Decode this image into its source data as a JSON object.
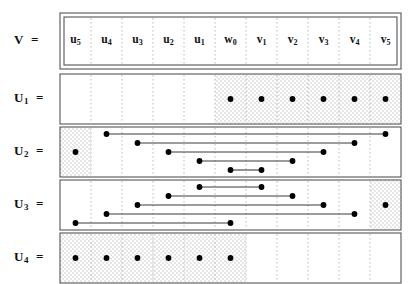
{
  "figure": {
    "title": ""
  },
  "row_labels": [
    {
      "name": "V",
      "sub": "",
      "eq": "="
    },
    {
      "name": "U",
      "sub": "1",
      "eq": "="
    },
    {
      "name": "U",
      "sub": "2",
      "eq": "="
    },
    {
      "name": "U",
      "sub": "3",
      "eq": "="
    },
    {
      "name": "U",
      "sub": "4",
      "eq": "="
    }
  ],
  "columns": [
    {
      "id": "u5",
      "base": "u",
      "sub": "5"
    },
    {
      "id": "u4",
      "base": "u",
      "sub": "4"
    },
    {
      "id": "u3",
      "base": "u",
      "sub": "3"
    },
    {
      "id": "u2",
      "base": "u",
      "sub": "2"
    },
    {
      "id": "u1",
      "base": "u",
      "sub": "1"
    },
    {
      "id": "w0",
      "base": "w",
      "sub": "0"
    },
    {
      "id": "v1",
      "base": "v",
      "sub": "1"
    },
    {
      "id": "v2",
      "base": "v",
      "sub": "2"
    },
    {
      "id": "v3",
      "base": "v",
      "sub": "3"
    },
    {
      "id": "v4",
      "base": "v",
      "sub": "4"
    },
    {
      "id": "v5",
      "base": "v",
      "sub": "5"
    }
  ],
  "rows": {
    "U1": {
      "shaded_columns": [
        "w0",
        "v1",
        "v2",
        "v3",
        "v4",
        "v5"
      ],
      "dots": [
        "w0",
        "v1",
        "v2",
        "v3",
        "v4",
        "v5"
      ],
      "segments": []
    },
    "U2": {
      "shaded_columns": [
        "u5"
      ],
      "dots": [
        "u5"
      ],
      "segments": [
        {
          "from": "u4",
          "to": "v5",
          "level": 1
        },
        {
          "from": "u3",
          "to": "v4",
          "level": 2
        },
        {
          "from": "u2",
          "to": "v3",
          "level": 3
        },
        {
          "from": "u1",
          "to": "v2",
          "level": 4
        },
        {
          "from": "w0",
          "to": "v1",
          "level": 5
        }
      ]
    },
    "U3": {
      "shaded_columns": [
        "v5"
      ],
      "dots": [
        "v5"
      ],
      "segments": [
        {
          "from": "u1",
          "to": "v1",
          "level": 1
        },
        {
          "from": "u2",
          "to": "v2",
          "level": 2
        },
        {
          "from": "u3",
          "to": "v3",
          "level": 3
        },
        {
          "from": "u4",
          "to": "v4",
          "level": 4
        },
        {
          "from": "u5",
          "to": "w0",
          "level": 5
        }
      ]
    },
    "U4": {
      "shaded_columns": [
        "u5",
        "u4",
        "u3",
        "u2",
        "u1",
        "w0"
      ],
      "dots": [
        "u5",
        "u4",
        "u3",
        "u2",
        "u1",
        "w0"
      ],
      "segments": []
    }
  },
  "style": {
    "dot_color": "#000000",
    "line_color": "#3a3a3a",
    "border_color": "#555555",
    "grid_color": "#b9b9b9",
    "shade_color": "#e6e6e6"
  },
  "geometry": {
    "table_left": 60,
    "table_right": 401,
    "header_top": 13,
    "header_bottom": 69,
    "row_tops": [
      74,
      127,
      180,
      233
    ],
    "row_height": 50
  }
}
